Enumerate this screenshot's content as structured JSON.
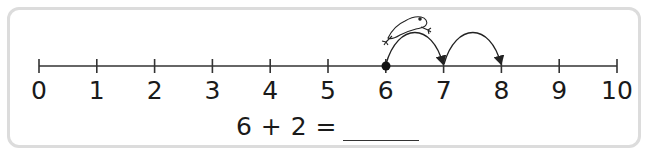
{
  "number_line": {
    "min": 0,
    "max": 10,
    "labels": [
      "0",
      "1",
      "2",
      "3",
      "4",
      "5",
      "6",
      "7",
      "8",
      "9",
      "10"
    ],
    "start_point": 6,
    "jumps": [
      [
        6,
        7
      ],
      [
        7,
        8
      ]
    ],
    "character": "frog"
  },
  "equation": {
    "text": "6 + 2 =",
    "answer_blank": ""
  }
}
